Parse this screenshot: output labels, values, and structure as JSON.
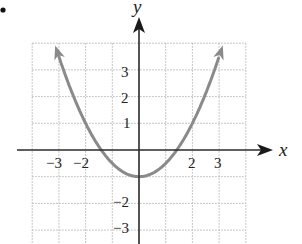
{
  "chart_data": {
    "type": "line",
    "title": "",
    "xlabel": "x",
    "ylabel": "y",
    "function": "y = x^2/2 - 1",
    "series": [
      {
        "name": "parabola",
        "x": [
          -3.16,
          -3,
          -2,
          -1.41,
          -1,
          0,
          1,
          1.41,
          2,
          3,
          3.16
        ],
        "y": [
          4,
          3.5,
          1,
          0,
          -0.5,
          -1,
          -0.5,
          0,
          1,
          3.5,
          4
        ],
        "color": "#8a8a8a",
        "arrows_at_ends": true
      }
    ],
    "vertex": {
      "x": 0,
      "y": -1
    },
    "x_intercepts": [
      -1.41,
      1.41
    ],
    "x_ticks": [
      "-3",
      "-2",
      "2",
      "3"
    ],
    "y_ticks": [
      "3",
      "2",
      "1",
      "-2",
      "-3"
    ],
    "xlim": [
      -4,
      4
    ],
    "ylim": [
      -3.6,
      4
    ],
    "grid": true,
    "grid_style": "dotted",
    "legend": null
  },
  "labels": {
    "x_axis": "x",
    "y_axis": "y",
    "x_ticks": [
      {
        "value": -3,
        "text": "−3"
      },
      {
        "value": -2,
        "text": "−2"
      },
      {
        "value": 2,
        "text": "2"
      },
      {
        "value": 3,
        "text": "3"
      }
    ],
    "y_ticks": [
      {
        "value": 3,
        "text": "3"
      },
      {
        "value": 2,
        "text": "2"
      },
      {
        "value": 1,
        "text": "1"
      },
      {
        "value": -2,
        "text": "−2"
      },
      {
        "value": -3,
        "text": "−3"
      }
    ]
  },
  "colors": {
    "axis": "#2a2a2a",
    "grid": "#b5b5b5",
    "curve": "#8a8a8a",
    "text": "#222222"
  }
}
